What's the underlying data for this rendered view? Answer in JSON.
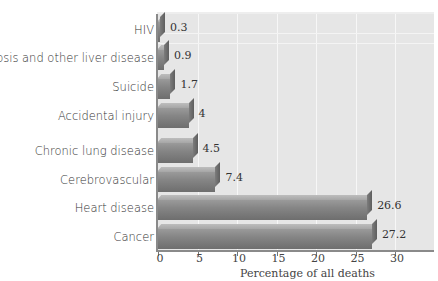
{
  "chart_data": {
    "type": "bar",
    "orientation": "horizontal",
    "title": "",
    "xlabel": "Percentage of all deaths",
    "ylabel": "",
    "categories": [
      "HIV",
      "Cirrhosis and other liver disease",
      "Suicide",
      "Accidental injury",
      "Chronic lung disease",
      "Cerebrovascular",
      "Heart disease",
      "Cancer"
    ],
    "values": [
      0.3,
      0.9,
      1.7,
      4,
      4.5,
      7.4,
      26.6,
      27.2
    ],
    "value_labels": [
      "0.3",
      "0.9",
      "1.7",
      "4",
      "4.5",
      "7.4",
      "26.6",
      "27.2"
    ],
    "xlim": [
      0,
      35
    ],
    "xticks": [
      "0",
      "5",
      "10",
      "15",
      "20",
      "25",
      "30"
    ],
    "grid": true,
    "legend": null,
    "style": "3D bars, gray"
  }
}
